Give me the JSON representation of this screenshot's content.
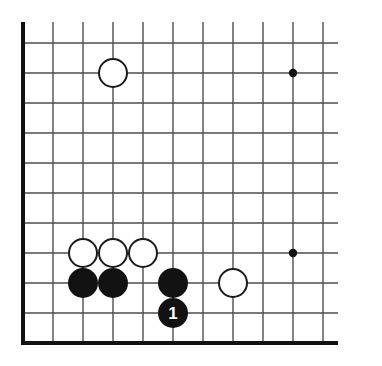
{
  "figure": {
    "kind": "go-board-diagram",
    "title": "",
    "caption": ""
  },
  "board": {
    "corner": "bottom-left",
    "cell_size": 30,
    "origin_x": 23,
    "origin_y": 43,
    "columns": 11,
    "rows": 11,
    "grid_color": "#4d4d4d",
    "edge_color": "#111111",
    "grid_line_width": 1.4,
    "edge_line_width": 4,
    "background": "#ffffff"
  },
  "star_points": [
    {
      "name": "star-point-upper",
      "col": 9,
      "row": 1
    },
    {
      "name": "star-point-lower",
      "col": 9,
      "row": 7
    }
  ],
  "stones": [
    {
      "name": "white-stone-upper-left",
      "color": "white",
      "col": 3,
      "row": 1,
      "label": ""
    },
    {
      "name": "white-stone-a",
      "color": "white",
      "col": 2,
      "row": 7,
      "label": ""
    },
    {
      "name": "white-stone-b",
      "color": "white",
      "col": 3,
      "row": 7,
      "label": ""
    },
    {
      "name": "white-stone-c",
      "color": "white",
      "col": 4,
      "row": 7,
      "label": ""
    },
    {
      "name": "black-stone-a",
      "color": "black",
      "col": 2,
      "row": 8,
      "label": ""
    },
    {
      "name": "black-stone-b",
      "color": "black",
      "col": 3,
      "row": 8,
      "label": ""
    },
    {
      "name": "black-stone-c",
      "color": "black",
      "col": 5,
      "row": 8,
      "label": ""
    },
    {
      "name": "white-stone-right",
      "color": "white",
      "col": 7,
      "row": 8,
      "label": ""
    },
    {
      "name": "black-stone-move-1",
      "color": "black",
      "col": 5,
      "row": 9,
      "label": "1"
    }
  ],
  "colors": {
    "black_stone": "#121212",
    "white_stone": "#ffffff",
    "stone_outline": "#1a1a1a",
    "grid": "#4d4d4d",
    "board_edge": "#111111",
    "label_on_black": "#ffffff",
    "label_on_white": "#111111",
    "paper": "#ffffff"
  }
}
